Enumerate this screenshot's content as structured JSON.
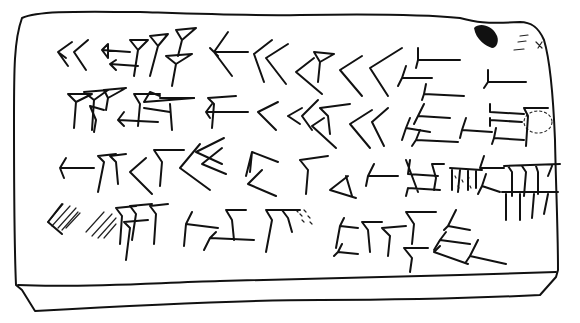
{
  "figure": {
    "subject": "Hand-drawn line copy of a cuneiform clay tablet (obverse)",
    "lines_of_text": 4,
    "ink_color": "#111111",
    "background_color": "#ffffff",
    "damage": [
      "dark blot top-right corner",
      "dashed broken area end of line 2",
      "hatched damaged signs start of line 4",
      "stippled traces in line 3"
    ]
  }
}
